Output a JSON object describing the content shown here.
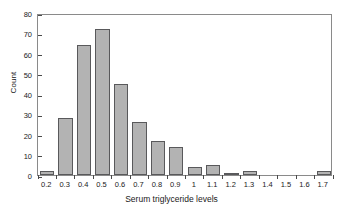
{
  "chart_data": {
    "type": "bar",
    "title": "",
    "xlabel": "Serum triglyceride levels",
    "ylabel": "Count",
    "categories": [
      "0.2",
      "0.3",
      "0.4",
      "0.5",
      "0.6",
      "0.7",
      "0.8",
      "0.9",
      "1",
      "1.1",
      "1.2",
      "1.3",
      "1.4",
      "1.5",
      "1.6",
      "1.7"
    ],
    "values": [
      2,
      28,
      64,
      72,
      45,
      26,
      17,
      14,
      4,
      5,
      1,
      2,
      0,
      0,
      0,
      2
    ],
    "ylim": [
      0,
      80
    ],
    "yticks": [
      0,
      10,
      20,
      30,
      40,
      50,
      60,
      70,
      80
    ],
    "ytick_labels": [
      "0",
      "10",
      "20",
      "30",
      "40",
      "50",
      "60",
      "70",
      "80"
    ],
    "grid": false,
    "legend": false,
    "bar_fill_color": "#b3b3b3",
    "bar_edge_color": "#59595b",
    "frame_color": "#8a8a8a"
  }
}
